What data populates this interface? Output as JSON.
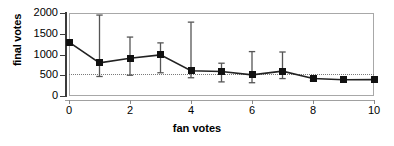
{
  "chart_data": {
    "type": "line",
    "title": "",
    "xlabel": "fan votes",
    "ylabel": "final votes",
    "xlim": [
      0,
      10
    ],
    "ylim": [
      0,
      2000
    ],
    "xticks": [
      0,
      2,
      4,
      6,
      8,
      10
    ],
    "yticks": [
      0,
      500,
      1000,
      1500,
      2000
    ],
    "xticklabels": [
      "0",
      "2",
      "4",
      "6",
      "8",
      "10"
    ],
    "yticklabels": [
      "0",
      "500",
      "1000",
      "1500",
      "2000"
    ],
    "grid": false,
    "legend": false,
    "marker": "square",
    "error_bars": true,
    "reference_line": {
      "orientation": "horizontal",
      "value": 540,
      "style": "dotted"
    },
    "x": [
      0,
      1,
      2,
      3,
      4,
      5,
      6,
      7,
      8,
      9,
      10
    ],
    "values": [
      1300,
      800,
      910,
      990,
      610,
      590,
      510,
      600,
      420,
      390,
      395
    ],
    "err_low": [
      1300,
      470,
      500,
      560,
      440,
      340,
      320,
      420,
      370,
      390,
      395
    ],
    "err_high": [
      1300,
      1950,
      1420,
      1280,
      1780,
      790,
      1070,
      1060,
      470,
      390,
      395
    ],
    "series": [
      {
        "name": "final votes",
        "values": [
          1300,
          800,
          910,
          990,
          610,
          590,
          510,
          600,
          420,
          390,
          395
        ]
      }
    ]
  },
  "colors": {
    "marker": "#111111",
    "line": "#222222",
    "error_bar": "#555555",
    "frame": "#a8a8a8",
    "axis": "#3b3b3b",
    "reference_line": "#7a7a7a",
    "background": "#ffffff"
  }
}
